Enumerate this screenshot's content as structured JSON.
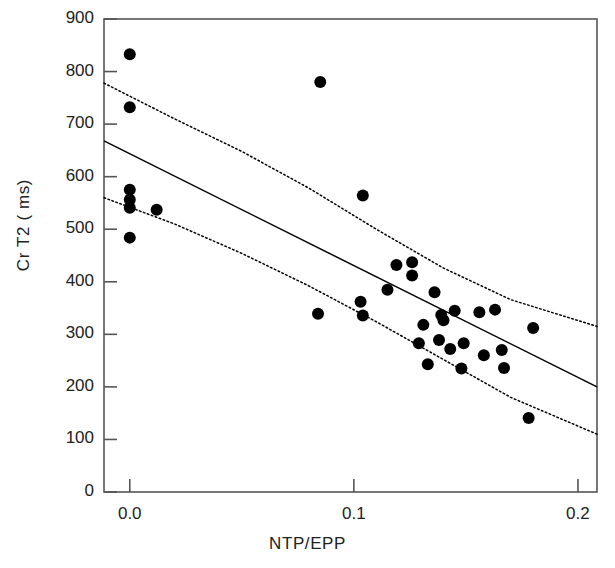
{
  "chart_data": {
    "type": "scatter",
    "title": "",
    "xlabel": "NTP/EPP",
    "ylabel": "Cr T2 ( ms)",
    "xlim": [
      -0.0115,
      0.2085
    ],
    "ylim": [
      0,
      900
    ],
    "xticks": [
      0.0,
      0.1,
      0.2
    ],
    "xtick_labels": [
      "0.0",
      "0.1",
      "0.2"
    ],
    "yticks": [
      0,
      100,
      200,
      300,
      400,
      500,
      600,
      700,
      800,
      900
    ],
    "ytick_labels": [
      "0",
      "100",
      "200",
      "300",
      "400",
      "500",
      "600",
      "700",
      "800",
      "900"
    ],
    "grid": false,
    "legend": "none",
    "marker": {
      "shape": "circle",
      "color": "#000000",
      "size_px": 12
    },
    "points": [
      {
        "x": 0.0,
        "y": 833
      },
      {
        "x": 0.0,
        "y": 732
      },
      {
        "x": 0.0,
        "y": 575
      },
      {
        "x": 0.0,
        "y": 556
      },
      {
        "x": 0.0,
        "y": 541
      },
      {
        "x": 0.0,
        "y": 484
      },
      {
        "x": 0.012,
        "y": 537
      },
      {
        "x": 0.085,
        "y": 780
      },
      {
        "x": 0.084,
        "y": 339
      },
      {
        "x": 0.104,
        "y": 564
      },
      {
        "x": 0.103,
        "y": 362
      },
      {
        "x": 0.104,
        "y": 336
      },
      {
        "x": 0.115,
        "y": 385
      },
      {
        "x": 0.119,
        "y": 432
      },
      {
        "x": 0.126,
        "y": 437
      },
      {
        "x": 0.126,
        "y": 412
      },
      {
        "x": 0.129,
        "y": 283
      },
      {
        "x": 0.131,
        "y": 318
      },
      {
        "x": 0.133,
        "y": 243
      },
      {
        "x": 0.136,
        "y": 380
      },
      {
        "x": 0.138,
        "y": 289
      },
      {
        "x": 0.139,
        "y": 337
      },
      {
        "x": 0.14,
        "y": 327
      },
      {
        "x": 0.143,
        "y": 272
      },
      {
        "x": 0.145,
        "y": 345
      },
      {
        "x": 0.148,
        "y": 235
      },
      {
        "x": 0.149,
        "y": 283
      },
      {
        "x": 0.156,
        "y": 342
      },
      {
        "x": 0.158,
        "y": 260
      },
      {
        "x": 0.163,
        "y": 347
      },
      {
        "x": 0.166,
        "y": 270
      },
      {
        "x": 0.167,
        "y": 236
      },
      {
        "x": 0.178,
        "y": 141
      },
      {
        "x": 0.18,
        "y": 312
      }
    ],
    "fit_line": {
      "style": "solid",
      "color": "#000000",
      "x_start": -0.0115,
      "y_start": 668,
      "x_end": 0.2085,
      "y_end": 200
    },
    "confidence_bands": [
      {
        "name": "upper-confidence-band",
        "style": "dotted",
        "color": "#000000",
        "points": [
          {
            "x": -0.0115,
            "y": 778
          },
          {
            "x": 0.02,
            "y": 710
          },
          {
            "x": 0.05,
            "y": 648
          },
          {
            "x": 0.08,
            "y": 578
          },
          {
            "x": 0.11,
            "y": 500
          },
          {
            "x": 0.14,
            "y": 426
          },
          {
            "x": 0.17,
            "y": 366
          },
          {
            "x": 0.2085,
            "y": 315
          }
        ]
      },
      {
        "name": "lower-confidence-band",
        "style": "dotted",
        "color": "#000000",
        "points": [
          {
            "x": -0.0115,
            "y": 560
          },
          {
            "x": 0.02,
            "y": 510
          },
          {
            "x": 0.05,
            "y": 454
          },
          {
            "x": 0.08,
            "y": 392
          },
          {
            "x": 0.11,
            "y": 324
          },
          {
            "x": 0.14,
            "y": 252
          },
          {
            "x": 0.17,
            "y": 180
          },
          {
            "x": 0.2085,
            "y": 110
          }
        ]
      }
    ]
  },
  "axes": {
    "frame_color": "#555555",
    "background": "#ffffff"
  }
}
